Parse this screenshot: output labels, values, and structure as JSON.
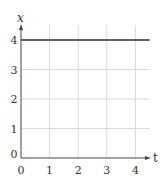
{
  "chart_data": {
    "type": "line",
    "title": "",
    "xlabel": "t",
    "ylabel": "x",
    "x_ticks": [
      "0",
      "1",
      "2",
      "3",
      "4"
    ],
    "y_ticks": [
      "0",
      "1",
      "2",
      "3",
      "4"
    ],
    "xlim": [
      0,
      4.5
    ],
    "ylim": [
      0,
      4.5
    ],
    "grid": true,
    "legend": null,
    "series": [
      {
        "name": "x(t)",
        "x": [
          0,
          4.5
        ],
        "y": [
          4,
          4
        ]
      }
    ]
  },
  "colors": {
    "line": "#333333",
    "grid": "#d8d8d8",
    "axis": "#444444"
  }
}
